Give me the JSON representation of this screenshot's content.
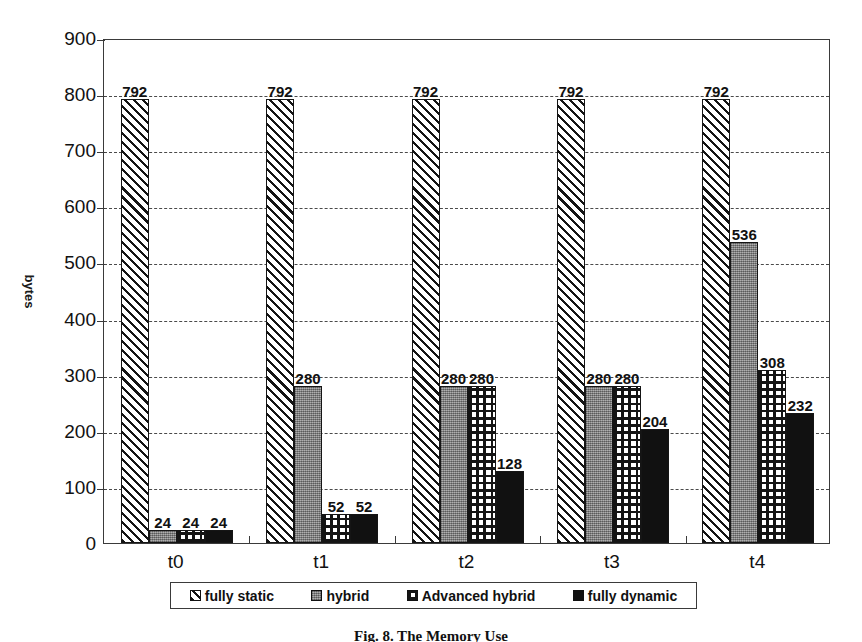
{
  "chart_data": {
    "type": "bar",
    "title": "",
    "xlabel": "",
    "ylabel": "bytes",
    "ylim": [
      0,
      900
    ],
    "ytick_values": [
      0,
      100,
      200,
      300,
      400,
      500,
      600,
      700,
      800,
      900
    ],
    "ytick_labels": [
      "0",
      "100",
      "200",
      "300",
      "400",
      "500",
      "600",
      "700",
      "800",
      "900"
    ],
    "grid": true,
    "grid_style": "dashed-horizontal",
    "legend_position": "bottom",
    "categories": [
      "t0",
      "t1",
      "t2",
      "t3",
      "t4"
    ],
    "series": [
      {
        "name": "fully static",
        "pattern": "diagonal-hatch",
        "color": "#ffffff",
        "values": [
          792,
          792,
          792,
          792,
          792
        ],
        "labels": [
          "792",
          "792",
          "792",
          "792",
          "792"
        ]
      },
      {
        "name": "hybrid",
        "pattern": "solid-grey",
        "color": "#8e8e8e",
        "values": [
          24,
          280,
          280,
          280,
          536
        ],
        "labels": [
          "24",
          "280",
          "280",
          "280",
          "536"
        ]
      },
      {
        "name": "Advanced hybrid",
        "pattern": "cross-hatch",
        "color": "#ffffff",
        "values": [
          24,
          52,
          280,
          280,
          308
        ],
        "labels": [
          "24",
          "52",
          "280",
          "280",
          "308"
        ]
      },
      {
        "name": "fully dynamic",
        "pattern": "solid-black",
        "color": "#111111",
        "values": [
          24,
          52,
          128,
          204,
          232
        ],
        "labels": [
          "24",
          "52",
          "128",
          "204",
          "232"
        ]
      }
    ]
  },
  "legend": {
    "items": [
      {
        "label": "fully static"
      },
      {
        "label": "hybrid"
      },
      {
        "label": "Advanced hybrid"
      },
      {
        "label": "fully dynamic"
      }
    ]
  },
  "caption": {
    "text": "Fig. 8. The Memory Use"
  }
}
